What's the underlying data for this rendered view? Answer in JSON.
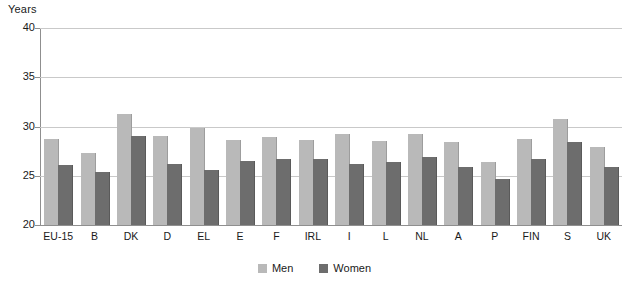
{
  "chart_data": {
    "type": "bar",
    "title": "",
    "subtitle": "",
    "xlabel": "",
    "ylabel": "Years",
    "ylim": [
      20,
      40
    ],
    "yticks": [
      20,
      25,
      30,
      35,
      40
    ],
    "ytick_labels": [
      "20",
      "25",
      "30",
      "35",
      "40"
    ],
    "grid": true,
    "legend_position": "bottom-center",
    "categories": [
      "EU-15",
      "B",
      "DK",
      "D",
      "EL",
      "E",
      "F",
      "IRL",
      "I",
      "L",
      "NL",
      "A",
      "P",
      "FIN",
      "S",
      "UK"
    ],
    "series": [
      {
        "name": "Men",
        "color": "#b9b9b9",
        "values": [
          28.7,
          27.3,
          31.3,
          29.0,
          29.8,
          28.6,
          28.9,
          28.6,
          29.2,
          28.5,
          29.2,
          28.4,
          26.4,
          28.7,
          30.8,
          27.9
        ]
      },
      {
        "name": "Women",
        "color": "#6d6d6d",
        "values": [
          26.1,
          25.4,
          29.0,
          26.2,
          25.6,
          26.5,
          26.7,
          26.7,
          26.2,
          26.4,
          26.9,
          25.9,
          24.7,
          26.7,
          28.4,
          25.9
        ]
      }
    ]
  },
  "axis": {
    "unit_label": "Years"
  },
  "legend": {
    "items": [
      {
        "label": "Men"
      },
      {
        "label": "Women"
      }
    ]
  }
}
